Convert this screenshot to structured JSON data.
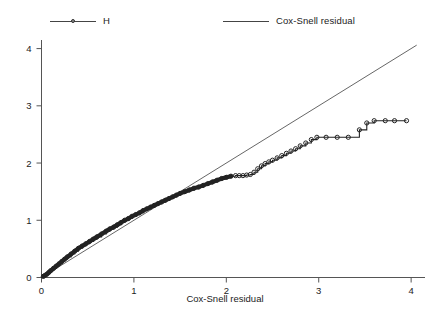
{
  "chart_data": {
    "type": "line",
    "title": "",
    "xlabel": "Cox-Snell residual",
    "ylabel": "",
    "xlim": [
      0,
      4.15
    ],
    "ylim": [
      0,
      4.15
    ],
    "grid": false,
    "legend_position": "top",
    "xticks": [
      0,
      1,
      2,
      3,
      4
    ],
    "yticks": [
      0,
      1,
      2,
      3,
      4
    ],
    "xtick_labels": [
      "0",
      "1",
      "2",
      "3",
      "4"
    ],
    "ytick_labels": [
      "0",
      "1",
      "2",
      "3",
      "4"
    ],
    "series": [
      {
        "name": "H",
        "style": "step-with-markers",
        "marker": "open-circle",
        "color": "#222222",
        "x": [
          0.02,
          0.04,
          0.06,
          0.08,
          0.1,
          0.13,
          0.16,
          0.19,
          0.22,
          0.25,
          0.28,
          0.32,
          0.36,
          0.4,
          0.44,
          0.48,
          0.52,
          0.56,
          0.6,
          0.65,
          0.7,
          0.74,
          0.78,
          0.82,
          0.86,
          0.9,
          0.94,
          0.98,
          1.02,
          1.06,
          1.1,
          1.14,
          1.18,
          1.22,
          1.26,
          1.3,
          1.34,
          1.38,
          1.42,
          1.46,
          1.5,
          1.55,
          1.6,
          1.65,
          1.7,
          1.75,
          1.8,
          1.85,
          1.9,
          1.95,
          2.0,
          2.05,
          2.1,
          2.14,
          2.18,
          2.22,
          2.26,
          2.3,
          2.34,
          2.38,
          2.42,
          2.46,
          2.5,
          2.55,
          2.6,
          2.65,
          2.7,
          2.75,
          2.8,
          2.86,
          2.92,
          2.98,
          3.08,
          3.2,
          3.32,
          3.44,
          3.52,
          3.6,
          3.72,
          3.82,
          3.95
        ],
        "y": [
          0.02,
          0.04,
          0.06,
          0.09,
          0.12,
          0.16,
          0.2,
          0.24,
          0.28,
          0.32,
          0.36,
          0.41,
          0.46,
          0.51,
          0.55,
          0.59,
          0.63,
          0.67,
          0.71,
          0.76,
          0.81,
          0.85,
          0.88,
          0.92,
          0.96,
          1.0,
          1.03,
          1.07,
          1.1,
          1.13,
          1.17,
          1.2,
          1.23,
          1.26,
          1.29,
          1.32,
          1.35,
          1.38,
          1.41,
          1.44,
          1.47,
          1.5,
          1.53,
          1.56,
          1.58,
          1.61,
          1.64,
          1.67,
          1.7,
          1.73,
          1.75,
          1.77,
          1.78,
          1.78,
          1.78,
          1.79,
          1.8,
          1.84,
          1.9,
          1.95,
          1.99,
          2.02,
          2.05,
          2.09,
          2.13,
          2.17,
          2.21,
          2.25,
          2.3,
          2.35,
          2.41,
          2.45,
          2.45,
          2.45,
          2.45,
          2.58,
          2.7,
          2.74,
          2.74,
          2.74,
          2.74
        ]
      },
      {
        "name": "Cox-Snell residual",
        "style": "reference-line",
        "color": "#555555",
        "x": [
          0.0,
          4.06
        ],
        "y": [
          0.0,
          4.06
        ]
      }
    ]
  },
  "legend": {
    "entries": [
      {
        "label": "H",
        "marker": "open-circle-line"
      },
      {
        "label": "Cox-Snell residual",
        "marker": "plain-line"
      }
    ]
  },
  "axes": {
    "x_title": "Cox-Snell residual",
    "x_tick_labels": [
      "0",
      "1",
      "2",
      "3",
      "4"
    ],
    "y_tick_labels": [
      "0",
      "1",
      "2",
      "3",
      "4"
    ]
  }
}
